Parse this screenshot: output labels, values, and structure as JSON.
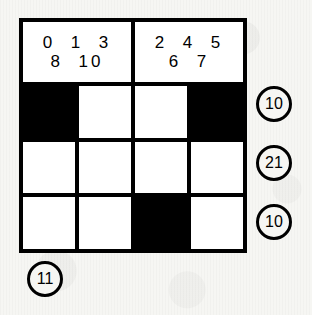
{
  "puzzle": {
    "headers": [
      {
        "name": "left-header",
        "lines": [
          "0  1  3",
          "8  10"
        ]
      },
      {
        "name": "right-header",
        "lines": [
          "2  4  5",
          "6  7"
        ]
      }
    ],
    "grid": {
      "columns": 4,
      "rows": [
        {
          "name": "grid-row-1",
          "cells": [
            "filled",
            "white",
            "white",
            "filled"
          ]
        },
        {
          "name": "grid-row-2",
          "cells": [
            "white",
            "white",
            "white",
            "white"
          ]
        },
        {
          "name": "grid-row-3",
          "cells": [
            "white",
            "white",
            "filled",
            "white"
          ]
        }
      ]
    },
    "row_clues": [
      "10",
      "21",
      "10"
    ],
    "column_clues": [
      "11"
    ],
    "colors": {
      "filled": "#000000",
      "empty": "#ffffff",
      "border": "#000000",
      "background": "#f6f6f3"
    }
  }
}
